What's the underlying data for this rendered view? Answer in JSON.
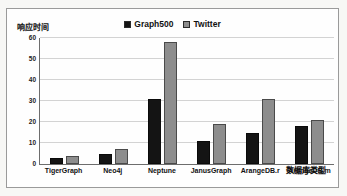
{
  "chart_data": {
    "type": "bar",
    "title": "",
    "xlabel": "数据库类型",
    "ylabel": "响应时间",
    "categories": [
      "TigerGraph",
      "Neo4j",
      "Neptune",
      "JanusGraph",
      "ArangeDB.r",
      "ArangeDB.m"
    ],
    "series": [
      {
        "name": "Graph500",
        "color": "#141414",
        "values": [
          3,
          5,
          31,
          11,
          15,
          18
        ]
      },
      {
        "name": "Twitter",
        "color": "#8d8d8d",
        "values": [
          4,
          7,
          58,
          19,
          31,
          21
        ]
      }
    ],
    "ylim": [
      0,
      60
    ],
    "yticks": [
      0,
      10,
      20,
      30,
      40,
      50,
      60
    ],
    "ytick_labels": [
      "0",
      "10",
      "20",
      "30",
      "40",
      "50",
      "60"
    ],
    "grid": true,
    "legend_position": "top-center"
  }
}
